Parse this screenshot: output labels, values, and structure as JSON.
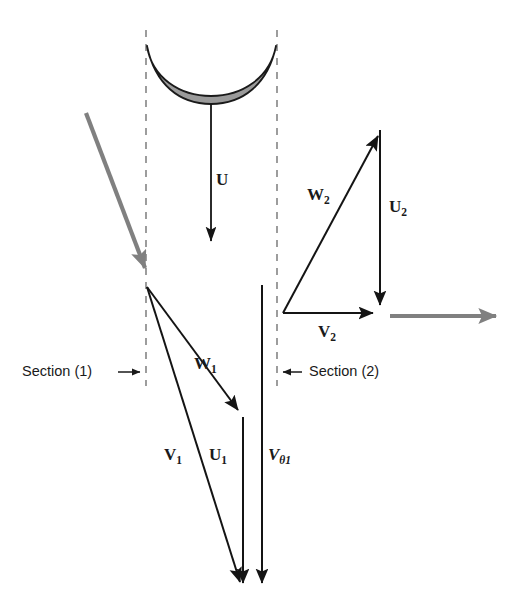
{
  "figure": {
    "background_color": "#ffffff",
    "width": 520,
    "height": 606
  },
  "colors": {
    "ink": "#1a1a1a",
    "vector_stroke": "#141414",
    "flow_arrow_gray": "#808080",
    "blade_fill": "#9a9a9a",
    "blade_outline": "#1a1a1a",
    "dashed_line": "#8c8c8c"
  },
  "section_markers": [
    {
      "id": "section-1",
      "label": "Section (1)",
      "arrow_direction": "right",
      "text_x": 22,
      "text_y": 372,
      "arrow_from_x": 118,
      "arrow_to_x": 146,
      "arrow_y": 372
    },
    {
      "id": "section-2",
      "label": "Section (2)",
      "arrow_direction": "left",
      "text_x": 306,
      "text_y": 372,
      "arrow_from_x": 300,
      "arrow_to_x": 277,
      "arrow_y": 372
    }
  ],
  "dashed_lines": [
    {
      "id": "dashed-section-1",
      "x": 146,
      "y1": 30,
      "y2": 386
    },
    {
      "id": "dashed-section-2",
      "x": 277,
      "y1": 30,
      "y2": 386
    }
  ],
  "blade": {
    "id": "rotor-blade",
    "description": "crescent shaped rotor blade cross-section",
    "left_tip_x": 147,
    "right_tip_x": 276,
    "tip_y": 46,
    "bottom_y": 95
  },
  "vectors": [
    {
      "id": "U",
      "label": "U",
      "label_sub": "",
      "label_italic": false,
      "label_x": 223,
      "label_y": 181,
      "x1": 211,
      "y1": 96,
      "x2": 211,
      "y2": 248,
      "color": "#141414",
      "width": 1.8,
      "style": "solid",
      "meaning": "blade speed at blade tip"
    },
    {
      "id": "W1",
      "label": "W",
      "label_sub": "1",
      "label_italic": false,
      "label_x": 196,
      "label_y": 365,
      "x1": 147,
      "y1": 287,
      "x2": 243,
      "y2": 417,
      "color": "#141414",
      "width": 2.0,
      "style": "solid",
      "meaning": "relative velocity at section 1"
    },
    {
      "id": "V1",
      "label": "V",
      "label_sub": "1",
      "label_italic": false,
      "label_x": 168,
      "label_y": 456,
      "x1": 147,
      "y1": 287,
      "x2": 243,
      "y2": 592,
      "color": "#141414",
      "width": 2.0,
      "style": "solid",
      "meaning": "absolute velocity at section 1"
    },
    {
      "id": "U1",
      "label": "U",
      "label_sub": "1",
      "label_italic": false,
      "label_x": 213,
      "label_y": 456,
      "x1": 243,
      "y1": 417,
      "x2": 243,
      "y2": 592,
      "color": "#141414",
      "width": 2.0,
      "style": "solid",
      "meaning": "blade speed at section 1"
    },
    {
      "id": "Vtheta1",
      "label": "V",
      "label_sub": "θ1",
      "label_italic": true,
      "label_x": 267,
      "label_y": 456,
      "x1": 262,
      "y1": 285,
      "x2": 262,
      "y2": 592,
      "color": "#141414",
      "width": 2.0,
      "style": "solid",
      "meaning": "tangential component of absolute velocity at section 1"
    },
    {
      "id": "W2",
      "label": "W",
      "label_sub": "2",
      "label_italic": false,
      "label_x": 311,
      "label_y": 196,
      "x1": 283,
      "y1": 313,
      "x2": 382,
      "y2": 130,
      "color": "#141414",
      "width": 2.0,
      "style": "solid",
      "meaning": "relative velocity at section 2"
    },
    {
      "id": "U2",
      "label": "U",
      "label_sub": "2",
      "label_italic": false,
      "label_x": 393,
      "label_y": 208,
      "x1": 380,
      "y1": 130,
      "x2": 380,
      "y2": 313,
      "color": "#141414",
      "width": 2.0,
      "style": "solid",
      "meaning": "blade speed at section 2"
    },
    {
      "id": "V2",
      "label": "V",
      "label_sub": "2",
      "label_italic": false,
      "label_x": 323,
      "label_y": 333,
      "x1": 283,
      "y1": 313,
      "x2": 380,
      "y2": 313,
      "color": "#141414",
      "width": 2.0,
      "style": "solid",
      "meaning": "absolute velocity at section 2"
    }
  ],
  "flow_arrows": [
    {
      "id": "inlet-flow-arrow",
      "x1": 86,
      "y1": 113,
      "x2": 148,
      "y2": 274,
      "color": "#808080",
      "width": 4.2,
      "meaning": "incoming flow direction"
    },
    {
      "id": "outlet-flow-arrow",
      "x1": 390,
      "y1": 316,
      "x2": 502,
      "y2": 316,
      "color": "#808080",
      "width": 4.2,
      "meaning": "outgoing flow direction"
    }
  ]
}
